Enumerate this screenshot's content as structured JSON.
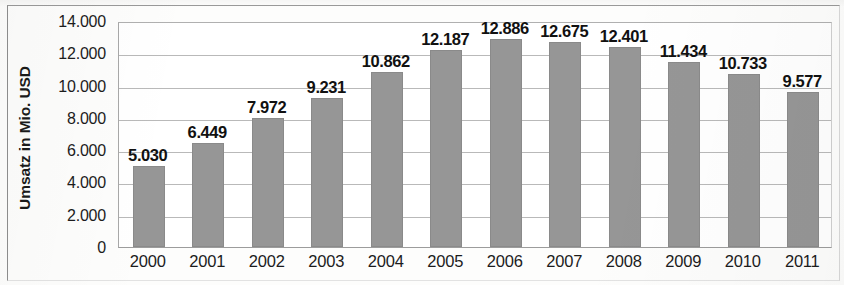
{
  "chart_data": {
    "type": "bar",
    "title": "",
    "subtitle": "",
    "xlabel": "",
    "ylabel": "Umsatz in Mio. USD",
    "categories": [
      "2000",
      "2001",
      "2002",
      "2003",
      "2004",
      "2005",
      "2006",
      "2007",
      "2008",
      "2009",
      "2010",
      "2011"
    ],
    "values": [
      5030,
      6449,
      7972,
      9231,
      10862,
      12187,
      12886,
      12675,
      12401,
      11434,
      10733,
      9577
    ],
    "value_labels": [
      "5.030",
      "6.449",
      "7.972",
      "9.231",
      "10.862",
      "12.187",
      "12.886",
      "12.675",
      "12.401",
      "11.434",
      "10.733",
      "9.577"
    ],
    "ylim": [
      0,
      14000
    ],
    "ytick_values": [
      0,
      2000,
      4000,
      6000,
      8000,
      10000,
      12000,
      14000
    ],
    "ytick_labels": [
      "0",
      "2.000",
      "4.000",
      "6.000",
      "8.000",
      "10.000",
      "12.000",
      "14.000"
    ],
    "grid": true,
    "legend": null,
    "legend_position": "none",
    "bar_color": "#969696",
    "gridline_color": "#b9b9b9",
    "plot_border_color": "#a8a8a8",
    "label_color": "#111111",
    "background_color": "#ffffff"
  }
}
